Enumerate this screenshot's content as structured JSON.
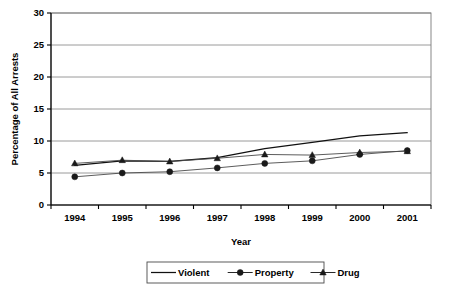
{
  "chart_data": {
    "type": "line",
    "title": "",
    "xlabel": "Year",
    "ylabel": "Percentage of All Arrests",
    "categories": [
      "1994",
      "1995",
      "1996",
      "1997",
      "1998",
      "1999",
      "2000",
      "2001"
    ],
    "x": [
      1994,
      1995,
      1996,
      1997,
      1998,
      1999,
      2000,
      2001
    ],
    "ylim": [
      0,
      30
    ],
    "yticks": [
      0,
      5,
      10,
      15,
      20,
      25,
      30
    ],
    "ytick_labels": [
      "0",
      "5",
      "10",
      "15",
      "20",
      "25",
      "30"
    ],
    "grid": true,
    "legend_position": "bottom",
    "series": [
      {
        "name": "Violent",
        "marker": "none",
        "values": [
          6.2,
          6.9,
          6.8,
          7.4,
          8.8,
          9.8,
          10.8,
          11.3
        ]
      },
      {
        "name": "Property",
        "marker": "circle",
        "values": [
          4.4,
          5.0,
          5.2,
          5.8,
          6.5,
          6.9,
          7.9,
          8.5
        ]
      },
      {
        "name": "Drug",
        "marker": "triangle",
        "values": [
          6.5,
          7.0,
          6.8,
          7.3,
          7.9,
          7.8,
          8.2,
          8.4
        ]
      }
    ]
  },
  "axes": {
    "y_title": "Percentage of All Arrests",
    "x_title": "Year",
    "y_ticks": [
      "0",
      "5",
      "10",
      "15",
      "20",
      "25",
      "30"
    ],
    "x_ticks": [
      "1994",
      "1995",
      "1996",
      "1997",
      "1998",
      "1999",
      "2000",
      "2001"
    ]
  },
  "legend": {
    "items": [
      {
        "label": "Violent",
        "marker": "line"
      },
      {
        "label": "Property",
        "marker": "circle"
      },
      {
        "label": "Drug",
        "marker": "triangle"
      }
    ]
  },
  "colors": {
    "line": "#111111",
    "grid": "#8f8f8f",
    "axis": "#000000",
    "background": "#ffffff"
  }
}
